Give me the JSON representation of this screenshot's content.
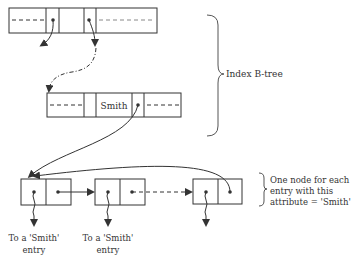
{
  "diagram": {
    "type": "index-btree-with-node-list",
    "top_node": {
      "description": "B-tree internal node with key and pointer slots"
    },
    "middle_node": {
      "key": "Smith"
    },
    "brace_label": "Index B-tree",
    "list_nodes": [
      {
        "id": 1,
        "label_line1": "To a 'Smith'",
        "label_line2": "entry"
      },
      {
        "id": 2,
        "label_line1": "To a 'Smith'",
        "label_line2": "entry"
      },
      {
        "id": 3
      }
    ],
    "list_brace_label": {
      "line1": "One node for each",
      "line2": "entry with this",
      "line3": "attribute = 'Smith'"
    },
    "colors": {
      "stroke": "#333333",
      "background": "#ffffff"
    }
  }
}
